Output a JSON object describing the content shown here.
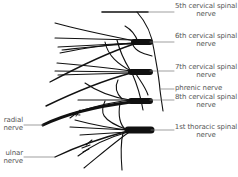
{
  "diagram": {
    "type": "anatomical illustration",
    "labels": {
      "c5": {
        "line1": "5th cervical spinal",
        "line2": "nerve"
      },
      "c6": {
        "line1": "6th cervical spinal",
        "line2": "nerve"
      },
      "c7": {
        "line1": "7th cervical spinal",
        "line2": "nerve"
      },
      "phrenic": {
        "line1": "phrenic nerve"
      },
      "c8": {
        "line1": "8th cervical spinal",
        "line2": "nerve"
      },
      "t1": {
        "line1": "1st thoracic spinal",
        "line2": "nerve"
      },
      "radial": {
        "line1": "radial",
        "line2": "nerve"
      },
      "ulnar": {
        "line1": "ulnar",
        "line2": "nerve"
      }
    },
    "colors": {
      "stroke": "#111111",
      "label_text": "#555555",
      "leader": "#777777",
      "background": "#ffffff"
    }
  }
}
